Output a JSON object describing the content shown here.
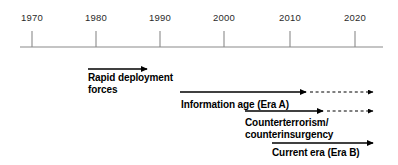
{
  "figure": {
    "type": "timeline",
    "background": "#ffffff",
    "axis_color": "#8a8a8a",
    "text_color": "#000000",
    "year_text_color": "#2b2b2b"
  },
  "axis": {
    "label": "year-axis",
    "start_x": 20,
    "end_x": 383,
    "y": 47,
    "tick_top": 31,
    "ticks": [
      {
        "year": "1970",
        "x": 32
      },
      {
        "year": "1980",
        "x": 96
      },
      {
        "year": "1990",
        "x": 160
      },
      {
        "year": "2000",
        "x": 224
      },
      {
        "year": "2010",
        "x": 290
      },
      {
        "year": "2020",
        "x": 355
      }
    ]
  },
  "eras": [
    {
      "name": "rapid-deployment-forces",
      "lines": [
        "Rapid deployment",
        "forces"
      ],
      "label_x": 88,
      "label_y": 72,
      "label_align": "left",
      "arrow": {
        "y": 69,
        "solid_start_x": 88,
        "solid_end_x": 147,
        "dashed": false,
        "dashed_end_x": null
      }
    },
    {
      "name": "information-age-era-a",
      "lines": [
        "Information age (Era A)"
      ],
      "label_x": 181,
      "label_y": 99,
      "label_align": "left",
      "arrow": {
        "y": 92,
        "solid_start_x": 180,
        "solid_end_x": 306,
        "dashed": true,
        "dashed_end_x": 373
      }
    },
    {
      "name": "counterterrorism-counterinsurgency",
      "lines": [
        "Counterterrorism/",
        "counterinsurgency"
      ],
      "label_x": 245,
      "label_y": 117,
      "label_align": "left",
      "arrow": {
        "y": 111,
        "solid_start_x": 245,
        "solid_end_x": 323,
        "dashed": true,
        "dashed_end_x": 373
      }
    },
    {
      "name": "current-era-era-b",
      "lines": [
        "Current era (Era B)"
      ],
      "label_x": 272,
      "label_y": 147,
      "label_align": "left",
      "arrow": {
        "y": 143,
        "solid_start_x": 272,
        "solid_end_x": 373,
        "dashed": false,
        "dashed_end_x": null
      }
    }
  ]
}
